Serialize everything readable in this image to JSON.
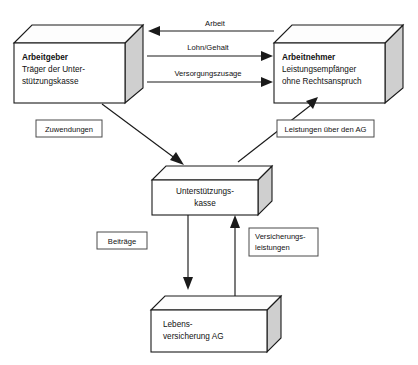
{
  "diagram": {
    "background_color": "#ffffff",
    "line_color": "#1a1a1a",
    "box_fill_color": "#ffffff",
    "box_side_shade_color": "#cfcfcf",
    "label_border_color": "#4a4a4a"
  },
  "nodes": {
    "employer": {
      "id": "arbeitgeber",
      "title": "Arbeitgeber",
      "line2": "Träger der Unter-",
      "line3": "stützungskasse",
      "shape": "3d-box"
    },
    "employee": {
      "id": "arbeitnehmer",
      "title": "Arbeitnehmer",
      "line2": "Leistungsempfänger",
      "line3": "ohne Rechtsanspruch",
      "shape": "3d-box"
    },
    "fund": {
      "id": "unterstuetzungskasse",
      "line1": "Unterstützungs-",
      "line2": "kasse",
      "shape": "3d-box"
    },
    "insurer": {
      "id": "lebensversicherung-ag",
      "line1": "Lebens-",
      "line2": "versicherung AG",
      "shape": "3d-box"
    }
  },
  "edges": {
    "work": {
      "label": "Arbeit",
      "from": "arbeitnehmer",
      "to": "arbeitgeber",
      "direction": "left"
    },
    "wage": {
      "label": "Lohn/Gehalt",
      "from": "arbeitgeber",
      "to": "arbeitnehmer",
      "direction": "right"
    },
    "pension_promise": {
      "label": "Versorgungszusage",
      "from": "arbeitgeber",
      "to": "arbeitnehmer",
      "direction": "right"
    },
    "allocations": {
      "label": "Zuwendungen",
      "from": "arbeitgeber",
      "to": "unterstuetzungskasse",
      "direction": "down-right"
    },
    "benefits_via_employer": {
      "label": "Leistungen über den AG",
      "from": "unterstuetzungskasse",
      "to": "arbeitnehmer",
      "direction": "up-right"
    },
    "contributions": {
      "label": "Beiträge",
      "from": "unterstuetzungskasse",
      "to": "lebensversicherung-ag",
      "direction": "down"
    },
    "insurance_benefits": {
      "label": "Versicherungs-",
      "label_line2": "leistungen",
      "from": "lebensversicherung-ag",
      "to": "unterstuetzungskasse",
      "direction": "up"
    }
  }
}
